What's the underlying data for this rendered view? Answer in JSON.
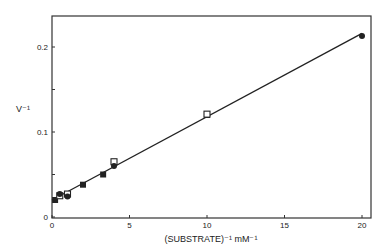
{
  "chart_data": {
    "type": "scatter",
    "title": "",
    "xlabel": "(SUBSTRATE)⁻¹  mM⁻¹",
    "ylabel": "V⁻¹",
    "xlim": [
      0,
      20.5
    ],
    "ylim": [
      0,
      0.238
    ],
    "x_ticks": [
      0,
      5,
      10,
      15,
      20
    ],
    "x_tick_labels": [
      "0",
      "5",
      "10",
      "15",
      "20"
    ],
    "y_ticks": [
      0,
      0.05,
      0.1,
      0.15,
      0.2
    ],
    "y_tick_labels": [
      "0",
      "",
      "0.1",
      "",
      "0.2"
    ],
    "grid": false,
    "legend": null,
    "series": [
      {
        "name": "filled squares",
        "marker": "square-filled",
        "x": [
          0.2,
          2.0,
          3.3,
          10.0
        ],
        "y": [
          0.02,
          0.038,
          0.05,
          0.12
        ]
      },
      {
        "name": "open squares",
        "marker": "square-open",
        "x": [
          0.5,
          1.0,
          4.0,
          10.0
        ],
        "y": [
          0.025,
          0.027,
          0.065,
          0.121
        ]
      },
      {
        "name": "filled circles",
        "marker": "circle-filled",
        "x": [
          0.5,
          1.0,
          4.0,
          20.0
        ],
        "y": [
          0.027,
          0.024,
          0.06,
          0.213
        ]
      }
    ],
    "fit_line": {
      "x": [
        0.0,
        20.0
      ],
      "y": [
        0.02,
        0.216
      ]
    }
  },
  "layout": {
    "plot_left_px": 52,
    "plot_right_px": 371,
    "plot_top_px": 16,
    "plot_bottom_px": 218,
    "px_per_x_unit": 15.5,
    "px_per_y_unit": 850,
    "y_zero_px": 217
  }
}
